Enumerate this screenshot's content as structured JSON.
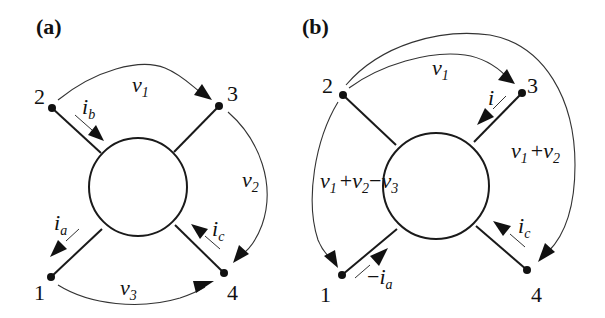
{
  "panels": {
    "a": {
      "label": "(a)",
      "nodes": {
        "n1": "1",
        "n2": "2",
        "n3": "3",
        "n4": "4"
      },
      "voltages": {
        "v1": {
          "base": "v",
          "sub": "1"
        },
        "v2": {
          "base": "v",
          "sub": "2"
        },
        "v3": {
          "base": "v",
          "sub": "3"
        }
      },
      "currents": {
        "ib": {
          "base": "i",
          "sub": "b"
        },
        "ia": {
          "base": "i",
          "sub": "a"
        },
        "ic": {
          "base": "i",
          "sub": "c"
        }
      }
    },
    "b": {
      "label": "(b)",
      "nodes": {
        "n1": "1",
        "n2": "2",
        "n3": "3",
        "n4": "4"
      },
      "voltages": {
        "v1": {
          "base": "v",
          "sub": "1"
        },
        "v1_plus_v2": {
          "t1": "v",
          "s1": "1",
          "op1": "+",
          "t2": "v",
          "s2": "2"
        },
        "v1_plus_v2_minus_v3": {
          "t1": "v",
          "s1": "1",
          "op1": "+",
          "t2": "v",
          "s2": "2",
          "op2": "−",
          "t3": "v",
          "s3": "3"
        }
      },
      "currents": {
        "i": {
          "base": "i"
        },
        "minus_ia": {
          "sign": "−",
          "base": "i",
          "sub": "a"
        },
        "ic": {
          "base": "i",
          "sub": "c"
        }
      }
    }
  }
}
